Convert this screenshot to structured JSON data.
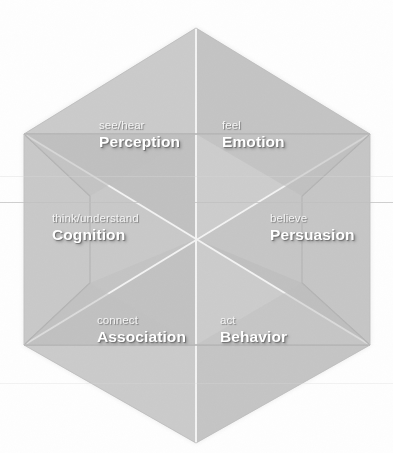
{
  "diagram": {
    "shape": "hexagon",
    "center": {
      "x": 196,
      "y": 239
    },
    "fill_color": "#c9c9c9",
    "crease_color": "#f2f2f2",
    "background": "#ffffff",
    "text_color": "#ffffff",
    "sectors": [
      {
        "id": "perception",
        "sub": "see/hear",
        "main": "Perception",
        "position": "top-left"
      },
      {
        "id": "emotion",
        "sub": "feel",
        "main": "Emotion",
        "position": "top-right"
      },
      {
        "id": "cognition",
        "sub": "think/understand",
        "main": "Cognition",
        "position": "left"
      },
      {
        "id": "persuasion",
        "sub": "believe",
        "main": "Persuasion",
        "position": "right"
      },
      {
        "id": "association",
        "sub": "connect",
        "main": "Association",
        "position": "bottom-left"
      },
      {
        "id": "behavior",
        "sub": "act",
        "main": "Behavior",
        "position": "bottom-right"
      }
    ]
  }
}
